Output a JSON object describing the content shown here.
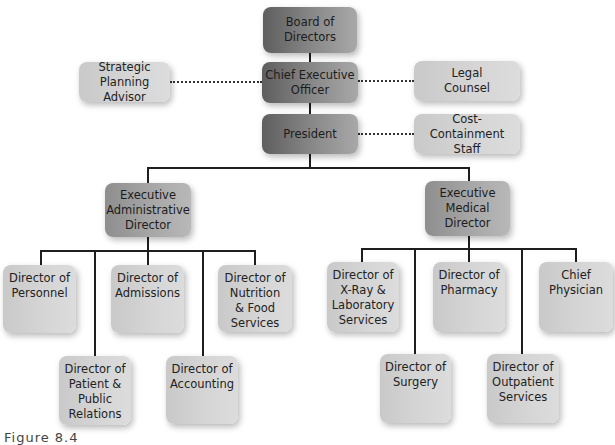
{
  "diagram": {
    "type": "org-chart",
    "nodes": {
      "board": {
        "line1": "Board of",
        "line2": "Directors"
      },
      "ceo": {
        "line1": "Chief Executive",
        "line2": "Officer"
      },
      "strategic": {
        "line1": "Strategic Planning",
        "line2": "Advisor"
      },
      "legal": {
        "line1": "Legal",
        "line2": "Counsel"
      },
      "president": {
        "line1": "President"
      },
      "cost": {
        "line1": "Cost-Containment",
        "line2": "Staff"
      },
      "exec_admin": {
        "line1": "Executive",
        "line2": "Administrative",
        "line3": "Director"
      },
      "exec_medical": {
        "line1": "Executive",
        "line2": "Medical",
        "line3": "Director"
      },
      "personnel": {
        "line1": "Director of",
        "line2": "Personnel"
      },
      "admissions": {
        "line1": "Director of",
        "line2": "Admissions"
      },
      "nutrition": {
        "line1": "Director of",
        "line2": "Nutrition",
        "line3": "& Food",
        "line4": "Services"
      },
      "patient": {
        "line1": "Director of",
        "line2": "Patient &",
        "line3": "Public",
        "line4": "Relations"
      },
      "accounting": {
        "line1": "Director of",
        "line2": "Accounting"
      },
      "xray": {
        "line1": "Director of",
        "line2": "X-Ray &",
        "line3": "Laboratory",
        "line4": "Services"
      },
      "pharmacy": {
        "line1": "Director of",
        "line2": "Pharmacy"
      },
      "physician": {
        "line1": "Chief",
        "line2": "Physician"
      },
      "surgery": {
        "line1": "Director of",
        "line2": "Surgery"
      },
      "outpatient": {
        "line1": "Director of",
        "line2": "Outpatient",
        "line3": "Services"
      }
    },
    "edges": [
      [
        "board",
        "ceo"
      ],
      [
        "ceo",
        "president"
      ],
      [
        "president",
        "exec_admin"
      ],
      [
        "president",
        "exec_medical"
      ],
      [
        "exec_admin",
        "personnel"
      ],
      [
        "exec_admin",
        "patient"
      ],
      [
        "exec_admin",
        "admissions"
      ],
      [
        "exec_admin",
        "accounting"
      ],
      [
        "exec_admin",
        "nutrition"
      ],
      [
        "exec_medical",
        "xray"
      ],
      [
        "exec_medical",
        "surgery"
      ],
      [
        "exec_medical",
        "pharmacy"
      ],
      [
        "exec_medical",
        "outpatient"
      ],
      [
        "exec_medical",
        "physician"
      ]
    ],
    "staff_links": [
      [
        "ceo",
        "strategic"
      ],
      [
        "ceo",
        "legal"
      ],
      [
        "president",
        "cost"
      ]
    ],
    "colors": {
      "top_level": "#6e6e6e",
      "executive": "#a0a0a0",
      "director": "#d0d0d0",
      "line": "#1e1e1e"
    }
  },
  "caption": "Figure 8.4"
}
